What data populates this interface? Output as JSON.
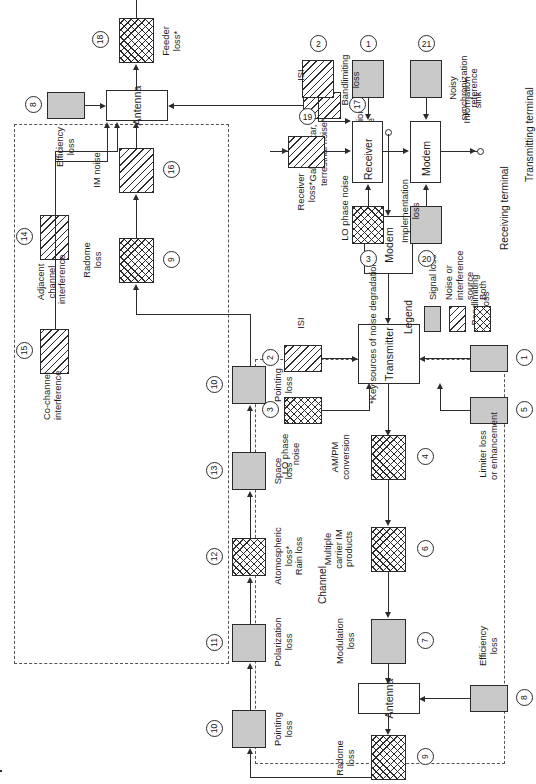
{
  "diagram": {
    "footnote": "*Key sources of noise degradation",
    "channel_label": "Channel",
    "terminals": {
      "transmitting": "Transmitting terminal",
      "receiving": "Receiving terminal"
    },
    "ports": {
      "source": "Information\nsource",
      "sink": "Information\nsink"
    }
  },
  "legend": {
    "title": "Legend",
    "items": [
      {
        "label": "Signal loss",
        "fill": "gray",
        "color": "#c9c9c9"
      },
      {
        "label": "Noise or\ninterference\nsource",
        "fill": "hatch",
        "color": "#ffffff"
      },
      {
        "label": "Both",
        "fill": "cross",
        "color": "#ffffff"
      }
    ]
  },
  "transmit_chain": {
    "name": "Transmitting terminal chain",
    "blocks": [
      {
        "id": "tx-modem",
        "label": "Modem",
        "fill": "open"
      },
      {
        "id": "tx-transmitter",
        "label": "Transmitter",
        "fill": "open"
      },
      {
        "id": "tx-antenna",
        "label": "Antenna",
        "fill": "open"
      }
    ],
    "impairments": [
      {
        "num": "1",
        "label": "Bandlimiting\nloss",
        "fill": "gray"
      },
      {
        "num": "5",
        "label": "Limiter loss\nor enhancement",
        "fill": "gray"
      },
      {
        "num": "2",
        "label": "ISI",
        "fill": "hatch"
      },
      {
        "num": "3",
        "label": "LO phase\nnoise",
        "fill": "cross"
      },
      {
        "num": "4",
        "label": "AM/PM\nconversion",
        "fill": "cross"
      },
      {
        "num": "6",
        "label": "Multiple\ncarrier IM\nproducts",
        "fill": "cross"
      },
      {
        "num": "7",
        "label": "Modulation\nloss",
        "fill": "gray"
      },
      {
        "num": "8",
        "label": "Efficiency\nloss",
        "fill": "gray"
      },
      {
        "num": "9",
        "label": "Radome\nloss",
        "fill": "cross"
      }
    ]
  },
  "channel_chain": {
    "name": "Channel impairments",
    "impairments": [
      {
        "num": "10",
        "label": "Pointing\nloss",
        "fill": "gray"
      },
      {
        "num": "11",
        "label": "Polarization\nloss",
        "fill": "gray"
      },
      {
        "num": "12",
        "label": "Atomospheric\nloss*\nRain loss",
        "fill": "cross"
      },
      {
        "num": "13",
        "label": "Space\nloss",
        "fill": "gray"
      },
      {
        "num": "10",
        "label": "Pointing\nloss",
        "fill": "gray"
      }
    ]
  },
  "receive_chain": {
    "name": "Receiving terminal chain",
    "blocks": [
      {
        "id": "rx-antenna",
        "label": "Antenna",
        "fill": "open"
      },
      {
        "id": "rx-receiver",
        "label": "Receiver",
        "fill": "open"
      },
      {
        "id": "rx-modem",
        "label": "Modem",
        "fill": "open"
      }
    ],
    "impairments": [
      {
        "num": "9",
        "label": "Radome\nloss",
        "fill": "cross"
      },
      {
        "num": "16",
        "label": "IM noise",
        "fill": "hatch"
      },
      {
        "num": "14",
        "label": "Adjacent\nchannel\ninterference",
        "fill": "hatch"
      },
      {
        "num": "15",
        "label": "Co-channel\ninterference",
        "fill": "hatch"
      },
      {
        "num": "8",
        "label": "Efficiency\nloss",
        "fill": "gray"
      },
      {
        "num": "17",
        "label": "Galactic, star,\nterrestrial noise*",
        "fill": "hatch"
      },
      {
        "num": "18",
        "label": "Feeder\nloss*",
        "fill": "cross"
      },
      {
        "num": "19",
        "label": "Receiver\nloss*",
        "fill": "hatch"
      },
      {
        "num": "2",
        "label": "ISI",
        "fill": "hatch"
      },
      {
        "num": "1",
        "label": "Bandlimiting\nloss",
        "fill": "gray"
      },
      {
        "num": "3",
        "label": "LO phase noise",
        "fill": "cross"
      },
      {
        "num": "20",
        "label": "Implementation\nloss",
        "fill": "gray"
      },
      {
        "num": "21",
        "label": "Noisy\nsynchronization\nreference",
        "fill": "gray"
      }
    ]
  },
  "labels": {
    "tx": {
      "modem": "Modem",
      "transmitter": "Transmitter",
      "antenna": "Antenna",
      "bandlimiting": "Bandlimiting\nloss",
      "limiter": "Limiter loss\nor enhancement",
      "isi": "ISI",
      "lo_phase": "LO phase\nnoise",
      "ampm": "AM/PM\nconversion",
      "im_products": "Multiple\ncarrier IM\nproducts",
      "modulation": "Modulation\nloss",
      "efficiency": "Efficiency\nloss",
      "radome": "Radome\nloss",
      "n1": "1",
      "n2": "2",
      "n3": "3",
      "n4": "4",
      "n5": "5",
      "n6": "6",
      "n7": "7",
      "n8": "8",
      "n9": "9"
    },
    "ch": {
      "pointing_a": "Pointing\nloss",
      "polarization": "Polarization\nloss",
      "atmospheric": "Atomospheric\nloss*\nRain loss",
      "space": "Space\nloss",
      "pointing_b": "Pointing\nloss",
      "n10a": "10",
      "n11": "11",
      "n12": "12",
      "n13": "13",
      "n10b": "10"
    },
    "rx": {
      "antenna": "Antenna",
      "receiver": "Receiver",
      "modem": "Modem",
      "radome": "Radome\nloss",
      "im_noise": "IM noise",
      "adjacent": "Adjacent\nchannel\ninterference",
      "cochannel": "Co-channel\ninterference",
      "efficiency": "Efficiency\nloss",
      "galactic": "Galactic, star,\nterrestrial noise*",
      "feeder": "Feeder\nloss*",
      "receiver_loss": "Receiver\nloss*",
      "isi": "ISI",
      "bandlimiting": "Bandlimiting\nloss",
      "lo_phase": "LO phase noise",
      "implementation": "Implementation\nloss",
      "noisy_sync": "Noisy\nsynchronization\nreference",
      "n9": "9",
      "n16": "16",
      "n14": "14",
      "n15": "15",
      "n8": "8",
      "n17": "17",
      "n18": "18",
      "n19": "19",
      "n2": "2",
      "n1": "1",
      "n3": "3",
      "n20": "20",
      "n21": "21"
    }
  }
}
